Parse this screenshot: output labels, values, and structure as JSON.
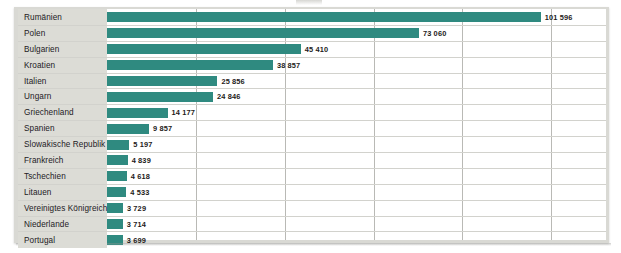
{
  "chart_data": {
    "type": "bar",
    "orientation": "horizontal",
    "title": "",
    "xlabel": "",
    "ylabel": "",
    "grid": true,
    "legend": false,
    "xlim": [
      0,
      104000
    ],
    "gridlines": [
      20000,
      40000,
      60000,
      80000,
      100000
    ],
    "bar_color": "#2f8a80",
    "label_column_color": "#dcdcd6",
    "categories": [
      "Rumänien",
      "Polen",
      "Bulgarien",
      "Kroatien",
      "Italien",
      "Ungarn",
      "Griechenland",
      "Spanien",
      "Slowakische Republik",
      "Frankreich",
      "Tschechien",
      "Litauen",
      "Vereinigtes Königreich",
      "Niederlande",
      "Portugal"
    ],
    "values": [
      101596,
      73060,
      45410,
      38857,
      25856,
      24846,
      14177,
      9857,
      5197,
      4839,
      4618,
      4533,
      3729,
      3714,
      3699
    ],
    "value_labels": [
      "101 596",
      "73 060",
      "45 410",
      "38 857",
      "25 856",
      "24 846",
      "14 177",
      "9 857",
      "5 197",
      "4 839",
      "4 618",
      "4 533",
      "3 729",
      "3 714",
      "3 699"
    ]
  }
}
